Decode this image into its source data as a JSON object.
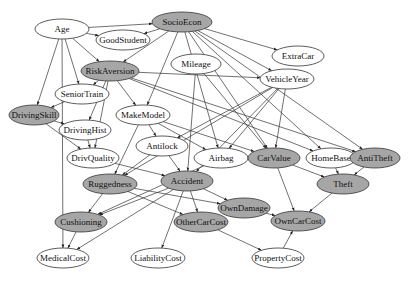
{
  "diagram": {
    "type": "bayesian-network",
    "colors": {
      "filled": "#a6a6a6",
      "unfilled": "#ffffff",
      "stroke": "#333333",
      "edge": "#333333"
    },
    "nodes": [
      {
        "id": "Age",
        "label": "Age",
        "x": 62,
        "y": 29,
        "rx": 27,
        "ry": 10,
        "filled": false
      },
      {
        "id": "SocioEcon",
        "label": "SocioEcon",
        "x": 182,
        "y": 22,
        "rx": 30,
        "ry": 10,
        "filled": true
      },
      {
        "id": "GoodStudent",
        "label": "GoodStudent",
        "x": 123,
        "y": 40,
        "rx": 27,
        "ry": 10,
        "filled": false
      },
      {
        "id": "RiskAversion",
        "label": "RiskAversion",
        "x": 110,
        "y": 71,
        "rx": 29,
        "ry": 10,
        "filled": true
      },
      {
        "id": "Mileage",
        "label": "Mileage",
        "x": 196,
        "y": 64,
        "rx": 25,
        "ry": 10,
        "filled": false
      },
      {
        "id": "ExtraCar",
        "label": "ExtraCar",
        "x": 298,
        "y": 56,
        "rx": 26,
        "ry": 10,
        "filled": false
      },
      {
        "id": "VehicleYear",
        "label": "VehicleYear",
        "x": 287,
        "y": 79,
        "rx": 27,
        "ry": 10,
        "filled": false
      },
      {
        "id": "SeniorTrain",
        "label": "SeniorTrain",
        "x": 82,
        "y": 94,
        "rx": 27,
        "ry": 10,
        "filled": false
      },
      {
        "id": "DrivingSkill",
        "label": "DrivingSkill",
        "x": 34,
        "y": 115,
        "rx": 25,
        "ry": 10,
        "filled": true
      },
      {
        "id": "MakeModel",
        "label": "MakeModel",
        "x": 143,
        "y": 115,
        "rx": 27,
        "ry": 10,
        "filled": false
      },
      {
        "id": "DrivingHist",
        "label": "DrivingHist",
        "x": 85,
        "y": 130,
        "rx": 26,
        "ry": 10,
        "filled": false
      },
      {
        "id": "Antilock",
        "label": "Antilock",
        "x": 162,
        "y": 146,
        "rx": 26,
        "ry": 10,
        "filled": false
      },
      {
        "id": "DrivQuality",
        "label": "DrivQuality",
        "x": 93,
        "y": 158,
        "rx": 26,
        "ry": 10,
        "filled": false
      },
      {
        "id": "Airbag",
        "label": "Airbag",
        "x": 221,
        "y": 158,
        "rx": 27,
        "ry": 10,
        "filled": false
      },
      {
        "id": "CarValue",
        "label": "CarValue",
        "x": 274,
        "y": 158,
        "rx": 26,
        "ry": 10,
        "filled": true
      },
      {
        "id": "HomeBase",
        "label": "HomeBase",
        "x": 331,
        "y": 158,
        "rx": 25,
        "ry": 10,
        "filled": false
      },
      {
        "id": "AntiTheft",
        "label": "AntiTheft",
        "x": 375,
        "y": 158,
        "rx": 25,
        "ry": 10,
        "filled": true
      },
      {
        "id": "Ruggedness",
        "label": "Ruggedness",
        "x": 110,
        "y": 184,
        "rx": 27,
        "ry": 10,
        "filled": true
      },
      {
        "id": "Accident",
        "label": "Accident",
        "x": 187,
        "y": 181,
        "rx": 26,
        "ry": 10,
        "filled": true
      },
      {
        "id": "Theft",
        "label": "Theft",
        "x": 343,
        "y": 184,
        "rx": 26,
        "ry": 10,
        "filled": true
      },
      {
        "id": "OwnDamage",
        "label": "OwnDamage",
        "x": 244,
        "y": 208,
        "rx": 26,
        "ry": 10,
        "filled": true
      },
      {
        "id": "Cushioning",
        "label": "Cushioning",
        "x": 81,
        "y": 222,
        "rx": 26,
        "ry": 10,
        "filled": true
      },
      {
        "id": "OtherCarCost",
        "label": "OtherCarCost",
        "x": 201,
        "y": 222,
        "rx": 27,
        "ry": 10,
        "filled": true
      },
      {
        "id": "OwnCarCost",
        "label": "OwnCarCost",
        "x": 298,
        "y": 221,
        "rx": 27,
        "ry": 10,
        "filled": true
      },
      {
        "id": "MedicalCost",
        "label": "MedicalCost",
        "x": 63,
        "y": 258,
        "rx": 26,
        "ry": 10,
        "filled": false
      },
      {
        "id": "LiabilityCost",
        "label": "LiabilityCost",
        "x": 158,
        "y": 258,
        "rx": 27,
        "ry": 10,
        "filled": false
      },
      {
        "id": "PropertyCost",
        "label": "PropertyCost",
        "x": 278,
        "y": 258,
        "rx": 26,
        "ry": 10,
        "filled": false
      }
    ],
    "edges": [
      [
        "Age",
        "SocioEcon"
      ],
      [
        "Age",
        "GoodStudent"
      ],
      [
        "Age",
        "RiskAversion"
      ],
      [
        "Age",
        "SeniorTrain"
      ],
      [
        "Age",
        "DrivingSkill"
      ],
      [
        "Age",
        "MedicalCost"
      ],
      [
        "SocioEcon",
        "GoodStudent"
      ],
      [
        "SocioEcon",
        "RiskAversion"
      ],
      [
        "SocioEcon",
        "MakeModel"
      ],
      [
        "SocioEcon",
        "ExtraCar"
      ],
      [
        "SocioEcon",
        "VehicleYear"
      ],
      [
        "SocioEcon",
        "HomeBase"
      ],
      [
        "SocioEcon",
        "AntiTheft"
      ],
      [
        "SocioEcon",
        "CarValue"
      ],
      [
        "SocioEcon",
        "Airbag"
      ],
      [
        "RiskAversion",
        "SeniorTrain"
      ],
      [
        "RiskAversion",
        "MakeModel"
      ],
      [
        "RiskAversion",
        "DrivingHist"
      ],
      [
        "RiskAversion",
        "DrivQuality"
      ],
      [
        "RiskAversion",
        "VehicleYear"
      ],
      [
        "RiskAversion",
        "HomeBase"
      ],
      [
        "RiskAversion",
        "AntiTheft"
      ],
      [
        "SeniorTrain",
        "DrivingSkill"
      ],
      [
        "DrivingSkill",
        "DrivingHist"
      ],
      [
        "DrivingSkill",
        "DrivQuality"
      ],
      [
        "DrivingHist",
        "DrivQuality"
      ],
      [
        "Mileage",
        "CarValue"
      ],
      [
        "Mileage",
        "Accident"
      ],
      [
        "VehicleYear",
        "Antilock"
      ],
      [
        "VehicleYear",
        "Airbag"
      ],
      [
        "VehicleYear",
        "CarValue"
      ],
      [
        "VehicleYear",
        "Ruggedness"
      ],
      [
        "VehicleYear",
        "Accident"
      ],
      [
        "MakeModel",
        "Antilock"
      ],
      [
        "MakeModel",
        "Airbag"
      ],
      [
        "MakeModel",
        "CarValue"
      ],
      [
        "MakeModel",
        "Ruggedness"
      ],
      [
        "Antilock",
        "Accident"
      ],
      [
        "Antilock",
        "Ruggedness"
      ],
      [
        "DrivQuality",
        "Accident"
      ],
      [
        "Airbag",
        "Cushioning"
      ],
      [
        "CarValue",
        "Theft"
      ],
      [
        "CarValue",
        "OwnCarCost"
      ],
      [
        "HomeBase",
        "Theft"
      ],
      [
        "AntiTheft",
        "Theft"
      ],
      [
        "Ruggedness",
        "Cushioning"
      ],
      [
        "Ruggedness",
        "OtherCarCost"
      ],
      [
        "Ruggedness",
        "OwnDamage"
      ],
      [
        "Accident",
        "OwnDamage"
      ],
      [
        "Accident",
        "OtherCarCost"
      ],
      [
        "Accident",
        "LiabilityCost"
      ],
      [
        "Accident",
        "MedicalCost"
      ],
      [
        "Accident",
        "Cushioning"
      ],
      [
        "Cushioning",
        "MedicalCost"
      ],
      [
        "OtherCarCost",
        "PropertyCost"
      ],
      [
        "OwnDamage",
        "OwnCarCost"
      ],
      [
        "Theft",
        "OwnCarCost"
      ],
      [
        "PropertyCost",
        "OwnCarCost"
      ]
    ]
  }
}
